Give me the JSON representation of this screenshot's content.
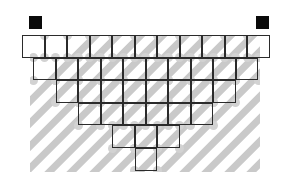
{
  "figure": {
    "type": "diagram",
    "canvas": {
      "width": 290,
      "height": 177,
      "background": "#ffffff"
    },
    "colors": {
      "cell_stroke": "#2b2b2b",
      "cell_fill": "none",
      "hatch_stripe": "#c9c9c9",
      "hatch_dot": "#d2d2d2",
      "marker_fill": "#0a0a0a",
      "page_background": "#ffffff"
    },
    "geometry": {
      "cell_width": 22.5,
      "cell_height": 22.6,
      "origin_x": 22,
      "origin_y": 35,
      "stroke_width": 1.6,
      "row_count": 6,
      "top_row_cell_count": 11
    },
    "rows": [
      {
        "index": 1,
        "cell_count": 11,
        "left_offset_cells": 0,
        "label": "row-1"
      },
      {
        "index": 2,
        "cell_count": 10,
        "left_offset_cells": 0.5,
        "label": "row-2"
      },
      {
        "index": 3,
        "cell_count": 8,
        "left_offset_cells": 1.5,
        "label": "row-3"
      },
      {
        "index": 4,
        "cell_count": 6,
        "left_offset_cells": 2.5,
        "label": "row-4"
      },
      {
        "index": 5,
        "cell_count": 3,
        "left_offset_cells": 4.0,
        "label": "row-5"
      },
      {
        "index": 6,
        "cell_count": 1,
        "left_offset_cells": 5.0,
        "label": "row-6"
      }
    ],
    "markers": [
      {
        "name": "marker-top-left",
        "x": 28,
        "y": 15,
        "size": 15
      },
      {
        "name": "marker-top-right",
        "x": 255,
        "y": 15,
        "size": 15
      }
    ],
    "hatch": {
      "direction": "bottom-left-to-top-right",
      "angle_degrees": -45,
      "stripe_thickness": 7,
      "spacing": 22.5,
      "region": {
        "x": 30,
        "y": 36,
        "width": 230,
        "height": 136
      }
    }
  }
}
